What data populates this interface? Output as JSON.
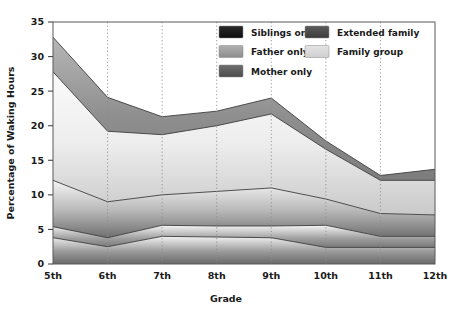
{
  "chart_data": {
    "type": "area",
    "stacked": true,
    "title": "",
    "xlabel": "Grade",
    "ylabel": "Percentage of Waking Hours",
    "categories": [
      "5th",
      "6th",
      "7th",
      "8th",
      "9th",
      "10th",
      "11th",
      "12th"
    ],
    "yticks": [
      0,
      5,
      10,
      15,
      20,
      25,
      30,
      35
    ],
    "ylim": [
      0,
      35
    ],
    "grid": "vertical-dotted",
    "legend_position": "top-right-inside",
    "series": [
      {
        "name": "Siblings only",
        "color": "#1c1c1c",
        "values": [
          3.8,
          2.5,
          4.0,
          3.9,
          3.8,
          2.4,
          2.4,
          2.4
        ]
      },
      {
        "name": "Mother only",
        "color": "#5a5a5a",
        "values": [
          1.6,
          1.3,
          1.6,
          1.6,
          1.7,
          3.2,
          1.6,
          1.6
        ]
      },
      {
        "name": "Father only",
        "color": "#9c9c9c",
        "values": [
          6.7,
          5.2,
          4.4,
          5.0,
          5.5,
          3.8,
          3.3,
          3.1
        ]
      },
      {
        "name": "Family group",
        "color": "#dcdcdc",
        "values": [
          15.7,
          10.2,
          8.7,
          9.5,
          10.7,
          7.2,
          4.8,
          5.0
        ]
      },
      {
        "name": "Extended family",
        "color": "#4a4a4a",
        "values": [
          5.0,
          4.9,
          2.6,
          2.1,
          2.3,
          1.2,
          0.7,
          1.6
        ]
      }
    ],
    "cumulative_boundaries": {
      "siblings_only": [
        3.8,
        2.5,
        4.0,
        3.9,
        3.8,
        2.4,
        2.4,
        2.4
      ],
      "mother_only": [
        5.4,
        3.8,
        5.6,
        5.5,
        5.5,
        5.6,
        4.0,
        4.0
      ],
      "father_only": [
        12.1,
        9.0,
        10.0,
        10.5,
        11.0,
        9.4,
        7.3,
        7.1
      ],
      "family_group": [
        27.8,
        19.2,
        18.7,
        20.0,
        21.7,
        16.6,
        12.1,
        12.1
      ],
      "extended_family": [
        32.8,
        24.1,
        21.3,
        22.1,
        24.0,
        17.8,
        12.8,
        13.7
      ]
    }
  },
  "axes": {
    "x_title": "Grade",
    "y_title": "Percentage of Waking Hours",
    "x_tick_labels": [
      "5th",
      "6th",
      "7th",
      "8th",
      "9th",
      "10th",
      "11th",
      "12th"
    ],
    "y_tick_labels": [
      "0",
      "5",
      "10",
      "15",
      "20",
      "25",
      "30",
      "35"
    ]
  },
  "legend": {
    "column_left": [
      {
        "label": "Siblings only",
        "swatch": "#1c1c1c"
      },
      {
        "label": "Father only",
        "swatch": "#9c9c9c"
      },
      {
        "label": "Mother only",
        "swatch": "#5a5a5a"
      }
    ],
    "column_right": [
      {
        "label": "Extended family",
        "swatch": "#4a4a4a"
      },
      {
        "label": "Family group",
        "swatch": "#dcdcdc"
      }
    ]
  }
}
